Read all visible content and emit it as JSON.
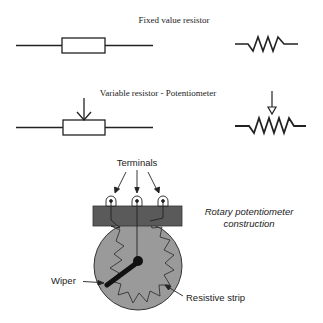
{
  "diagram": {
    "fixed_section": {
      "title": "Fixed value resistor",
      "symbols": [
        "box-symbol",
        "zigzag-symbol"
      ]
    },
    "variable_section": {
      "title": "Variable resistor - Potentiometer",
      "symbols": [
        "box-with-arrow-symbol",
        "zigzag-with-arrow-symbol"
      ]
    },
    "rotary_section": {
      "caption_line1": "Rotary potentiometer",
      "caption_line2": "construction",
      "labels": {
        "terminals": "Terminals",
        "wiper": "Wiper",
        "resistive_strip": "Resistive strip"
      },
      "colors": {
        "body": "#9a9a9a",
        "terminal_bar": "#5a5a5a",
        "lines": "#222222"
      }
    }
  }
}
